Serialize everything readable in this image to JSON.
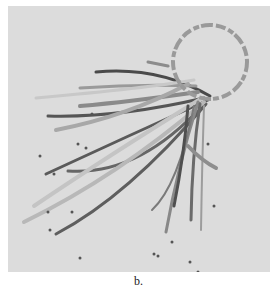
{
  "figure": {
    "caption": "b.",
    "background": "#dcdcdc",
    "circle": {
      "cx": 202,
      "cy": 56,
      "r": 37,
      "stroke": "#9a9a9a"
    },
    "lines": [
      {
        "d": "M202 90 Q150 60 88 66",
        "color": "#4a4a4a",
        "w": 3
      },
      {
        "d": "M196 92 Q110 112 40 110",
        "color": "#555555",
        "w": 3
      },
      {
        "d": "M200 94 Q120 130 38 168",
        "color": "#5a5a5a",
        "w": 3
      },
      {
        "d": "M194 100 Q130 170 60 165",
        "color": "#666666",
        "w": 3
      },
      {
        "d": "M198 98 Q120 190 48 228",
        "color": "#5e5e5e",
        "w": 3
      },
      {
        "d": "M196 96 Q110 170 16 216",
        "color": "#b8b8b8",
        "w": 4
      },
      {
        "d": "M194 92 Q100 150 26 200",
        "color": "#c4c4c4",
        "w": 4
      },
      {
        "d": "M190 86 Q120 96 72 100",
        "color": "#8a8a8a",
        "w": 4
      },
      {
        "d": "M188 80 Q130 78 72 82",
        "color": "#9a9a9a",
        "w": 3
      },
      {
        "d": "M186 74 Q140 82 28 92",
        "color": "#c8c8c8",
        "w": 3
      },
      {
        "d": "M180 78 Q120 110 48 124",
        "color": "#a8a8a8",
        "w": 4
      },
      {
        "d": "M160 60 L140 56",
        "color": "#8c8c8c",
        "w": 3
      },
      {
        "d": "M190 96 Q170 160 158 226",
        "color": "#888888",
        "w": 3
      },
      {
        "d": "M186 100 Q170 180 144 204",
        "color": "#7a7a7a",
        "w": 2
      },
      {
        "d": "M192 98 Q184 150 183 214",
        "color": "#6a6a6a",
        "w": 3
      },
      {
        "d": "M196 100 Q194 160 193 224",
        "color": "#9c9c9c",
        "w": 2
      },
      {
        "d": "M180 140 Q194 155 208 162",
        "color": "#8e8e8e",
        "w": 4
      },
      {
        "d": "M180 100 Q176 150 166 200",
        "color": "#4f4f4f",
        "w": 3
      }
    ],
    "dots": [
      [
        84,
        108
      ],
      [
        32,
        150
      ],
      [
        70,
        138
      ],
      [
        78,
        142
      ],
      [
        46,
        168
      ],
      [
        40,
        206
      ],
      [
        64,
        206
      ],
      [
        200,
        138
      ],
      [
        206,
        200
      ],
      [
        164,
        236
      ],
      [
        146,
        248
      ],
      [
        72,
        252
      ],
      [
        182,
        256
      ],
      [
        190,
        266
      ],
      [
        150,
        250
      ],
      [
        42,
        224
      ]
    ]
  }
}
